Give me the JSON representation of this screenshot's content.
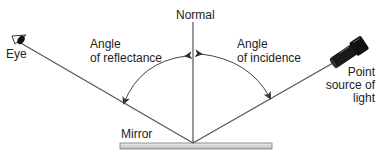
{
  "diagram": {
    "labels": {
      "normal": "Normal",
      "eye": "Eye",
      "angle_reflectance_line1": "Angle",
      "angle_reflectance_line2": "of reflectance",
      "angle_incidence_line1": "Angle",
      "angle_incidence_line2": "of incidence",
      "source_line1": "Point",
      "source_line2": "source of",
      "source_line3": "light",
      "mirror": "Mirror"
    },
    "colors": {
      "line": "#555555",
      "mirror_fill": "#d8d8d8",
      "mirror_stroke": "#777777",
      "flashlight": "#1a1a1a",
      "text": "#222222"
    }
  }
}
